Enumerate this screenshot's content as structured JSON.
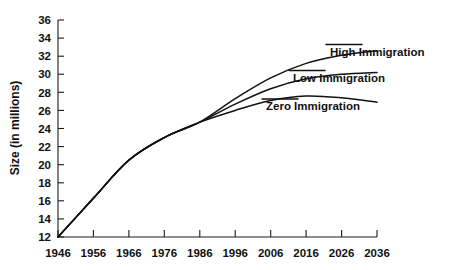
{
  "chart_data": {
    "type": "line",
    "title": "",
    "xlabel": "",
    "ylabel": "Size (in millions)",
    "xlim": [
      1946,
      2036
    ],
    "ylim": [
      12,
      36
    ],
    "grid": false,
    "legend_position": "inline-right-labels",
    "x": [
      1946,
      1956,
      1966,
      1976,
      1986,
      1996,
      2006,
      2016,
      2026,
      2036
    ],
    "xticks": [
      "1946",
      "1956",
      "1966",
      "1976",
      "1986",
      "1996",
      "2006",
      "2016",
      "2026",
      "2036"
    ],
    "yticks": [
      "12",
      "14",
      "16",
      "18",
      "20",
      "22",
      "24",
      "26",
      "28",
      "30",
      "32",
      "34",
      "36"
    ],
    "series": [
      {
        "name": "High Immigration",
        "values": [
          12.0,
          16.3,
          20.5,
          23.0,
          24.7,
          27.3,
          29.6,
          31.2,
          32.1,
          32.6
        ]
      },
      {
        "name": "Low Immigration",
        "values": [
          12.0,
          16.3,
          20.5,
          23.0,
          24.7,
          26.7,
          28.4,
          29.5,
          30.0,
          30.2
        ]
      },
      {
        "name": "Zero Immigration",
        "values": [
          12.0,
          16.3,
          20.5,
          23.0,
          24.7,
          26.0,
          27.1,
          27.6,
          27.4,
          26.9
        ]
      }
    ]
  },
  "axis": {
    "y_title": "Size (in millions)"
  },
  "labels": {
    "high": "High Immigration",
    "low": "Low Immigration",
    "zero": "Zero Immigration"
  },
  "colors": {
    "line": "#111111",
    "axis": "#1a1a1a",
    "background": "#ffffff"
  }
}
